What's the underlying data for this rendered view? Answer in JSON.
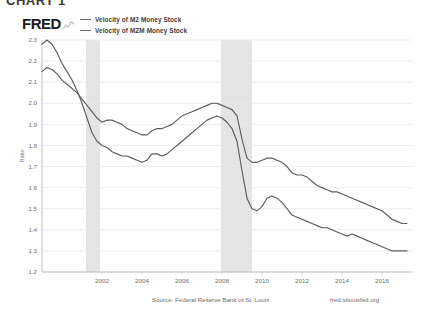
{
  "figure": {
    "title": "CHART 1"
  },
  "brand": {
    "logo_text": "FRED",
    "logo_icon": "sparkline-icon"
  },
  "footer": {
    "source": "Source: Federal Reserve Bank of St. Louis",
    "url": "fred.stlouisfed.org"
  },
  "chart_data": {
    "type": "line",
    "title": "",
    "xlabel": "",
    "ylabel": "Ratio",
    "grid": true,
    "legend_position": "top-left",
    "xlim": [
      1999.0,
      2017.5
    ],
    "ylim": [
      1.2,
      2.3
    ],
    "yticks": [
      "2.3",
      "2.2",
      "2.1",
      "2.0",
      "1.9",
      "1.8",
      "1.7",
      "1.6",
      "1.5",
      "1.4",
      "1.3",
      "1.2"
    ],
    "ytick_values": [
      2.3,
      2.2,
      2.1,
      2.0,
      1.9,
      1.8,
      1.7,
      1.6,
      1.5,
      1.4,
      1.3,
      1.2
    ],
    "xticks": [
      "2002",
      "2004",
      "2006",
      "2008",
      "2010",
      "2012",
      "2014",
      "2016"
    ],
    "xtick_values": [
      2002,
      2004,
      2006,
      2008,
      2010,
      2012,
      2014,
      2016
    ],
    "line_color": "#5c5c5c",
    "shaded_regions": [
      {
        "label": "recession",
        "start": 2001.2,
        "end": 2001.9,
        "color": "#e4e4e4"
      },
      {
        "label": "recession",
        "start": 2007.95,
        "end": 2009.5,
        "color": "#e4e4e4"
      }
    ],
    "series": [
      {
        "name": "Velocity of M2 Money Stock",
        "x": [
          1999.0,
          1999.25,
          1999.5,
          1999.75,
          2000.0,
          2000.25,
          2000.5,
          2000.75,
          2001.0,
          2001.25,
          2001.5,
          2001.75,
          2002.0,
          2002.25,
          2002.5,
          2002.75,
          2003.0,
          2003.25,
          2003.5,
          2003.75,
          2004.0,
          2004.25,
          2004.5,
          2004.75,
          2005.0,
          2005.25,
          2005.5,
          2005.75,
          2006.0,
          2006.25,
          2006.5,
          2006.75,
          2007.0,
          2007.25,
          2007.5,
          2007.75,
          2008.0,
          2008.25,
          2008.5,
          2008.75,
          2009.0,
          2009.25,
          2009.5,
          2009.75,
          2010.0,
          2010.25,
          2010.5,
          2010.75,
          2011.0,
          2011.25,
          2011.5,
          2011.75,
          2012.0,
          2012.25,
          2012.5,
          2012.75,
          2013.0,
          2013.25,
          2013.5,
          2013.75,
          2014.0,
          2014.25,
          2014.5,
          2014.75,
          2015.0,
          2015.25,
          2015.5,
          2015.75,
          2016.0,
          2016.25,
          2016.5,
          2016.75,
          2017.0,
          2017.25
        ],
        "y": [
          2.15,
          2.17,
          2.16,
          2.14,
          2.11,
          2.09,
          2.07,
          2.05,
          2.02,
          1.99,
          1.96,
          1.93,
          1.91,
          1.92,
          1.92,
          1.91,
          1.9,
          1.88,
          1.87,
          1.86,
          1.85,
          1.85,
          1.87,
          1.88,
          1.88,
          1.89,
          1.9,
          1.92,
          1.94,
          1.95,
          1.96,
          1.97,
          1.98,
          1.99,
          2.0,
          2.0,
          1.99,
          1.98,
          1.97,
          1.94,
          1.83,
          1.74,
          1.72,
          1.72,
          1.73,
          1.74,
          1.74,
          1.73,
          1.72,
          1.7,
          1.67,
          1.66,
          1.66,
          1.65,
          1.63,
          1.61,
          1.6,
          1.59,
          1.58,
          1.58,
          1.57,
          1.56,
          1.55,
          1.54,
          1.53,
          1.52,
          1.51,
          1.5,
          1.49,
          1.47,
          1.45,
          1.44,
          1.43,
          1.43
        ]
      },
      {
        "name": "Velocity of MZM Money Stock",
        "x": [
          1999.0,
          1999.25,
          1999.5,
          1999.75,
          2000.0,
          2000.25,
          2000.5,
          2000.75,
          2001.0,
          2001.25,
          2001.5,
          2001.75,
          2002.0,
          2002.25,
          2002.5,
          2002.75,
          2003.0,
          2003.25,
          2003.5,
          2003.75,
          2004.0,
          2004.25,
          2004.5,
          2004.75,
          2005.0,
          2005.25,
          2005.5,
          2005.75,
          2006.0,
          2006.25,
          2006.5,
          2006.75,
          2007.0,
          2007.25,
          2007.5,
          2007.75,
          2008.0,
          2008.25,
          2008.5,
          2008.75,
          2009.0,
          2009.25,
          2009.5,
          2009.75,
          2010.0,
          2010.25,
          2010.5,
          2010.75,
          2011.0,
          2011.25,
          2011.5,
          2011.75,
          2012.0,
          2012.25,
          2012.5,
          2012.75,
          2013.0,
          2013.25,
          2013.5,
          2013.75,
          2014.0,
          2014.25,
          2014.5,
          2014.75,
          2015.0,
          2015.25,
          2015.5,
          2015.75,
          2016.0,
          2016.25,
          2016.5,
          2016.75,
          2017.0,
          2017.25
        ],
        "y": [
          2.28,
          2.3,
          2.28,
          2.24,
          2.19,
          2.15,
          2.11,
          2.06,
          2.0,
          1.93,
          1.86,
          1.82,
          1.8,
          1.79,
          1.77,
          1.76,
          1.75,
          1.75,
          1.74,
          1.73,
          1.72,
          1.73,
          1.76,
          1.76,
          1.75,
          1.76,
          1.78,
          1.8,
          1.82,
          1.84,
          1.86,
          1.88,
          1.9,
          1.92,
          1.93,
          1.94,
          1.93,
          1.91,
          1.88,
          1.82,
          1.68,
          1.55,
          1.5,
          1.49,
          1.51,
          1.55,
          1.56,
          1.55,
          1.53,
          1.5,
          1.47,
          1.46,
          1.45,
          1.44,
          1.43,
          1.42,
          1.41,
          1.41,
          1.4,
          1.39,
          1.38,
          1.37,
          1.38,
          1.37,
          1.36,
          1.35,
          1.34,
          1.33,
          1.32,
          1.31,
          1.3,
          1.3,
          1.3,
          1.3
        ]
      }
    ]
  }
}
